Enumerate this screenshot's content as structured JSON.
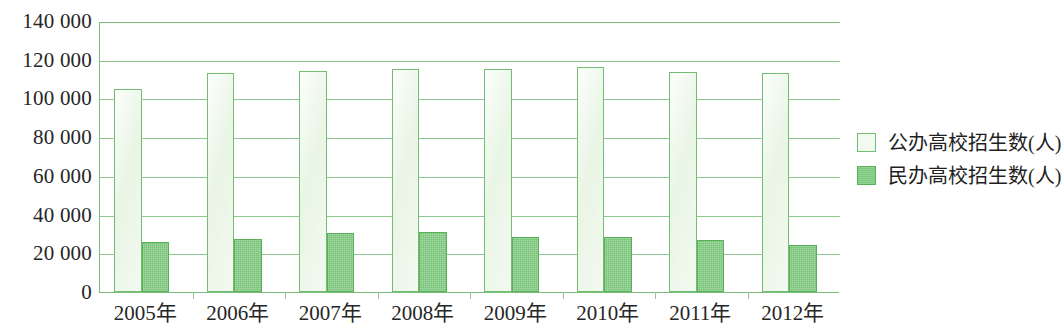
{
  "chart_data": {
    "type": "bar",
    "title": "",
    "subtitle": "",
    "xlabel": "",
    "ylabel": "",
    "categories": [
      "2005年",
      "2006年",
      "2007年",
      "2008年",
      "2009年",
      "2010年",
      "2011年",
      "2012年"
    ],
    "series": [
      {
        "name": "公办高校招生数(人)",
        "color": "#f0f8ed",
        "border_color": "#72bd72",
        "values": [
          105000,
          113000,
          114000,
          115000,
          115000,
          116500,
          113500,
          113000
        ]
      },
      {
        "name": "民办高校招生数(人)",
        "color": "#7ecb7e",
        "border_color": "#58b158",
        "values": [
          26000,
          27500,
          30500,
          31000,
          28500,
          28500,
          27000,
          24500
        ]
      }
    ],
    "ylim": [
      0,
      140000
    ],
    "ytick_values": [
      0,
      20000,
      40000,
      60000,
      80000,
      100000,
      120000,
      140000
    ],
    "ytick_labels": [
      "0",
      "20 000",
      "40 000",
      "60 000",
      "80 000",
      "100 000",
      "120 000",
      "140 000"
    ],
    "grid": true,
    "grid_color": "#8fc98f",
    "legend_position": "right",
    "axis_color": "#79bd79",
    "background": "#ffffff"
  },
  "legend": {
    "items": [
      {
        "label": "公办高校招生数(人)",
        "swatch": "public"
      },
      {
        "label": "民办高校招生数(人)",
        "swatch": "private"
      }
    ]
  }
}
